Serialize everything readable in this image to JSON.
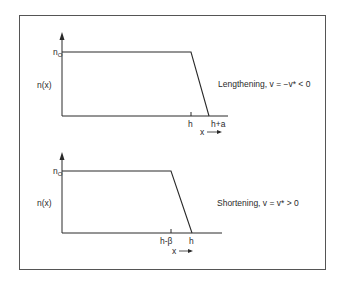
{
  "figure": {
    "panels": [
      {
        "id": "lengthening",
        "y_axis_label": "n(x)",
        "y_level_label": "n",
        "y_level_subscript": "O",
        "x_axis_label": "x",
        "tick_labels": [
          "h",
          "h+a"
        ],
        "caption": "Lengthening, v = −v* < 0"
      },
      {
        "id": "shortening",
        "y_axis_label": "n(x)",
        "y_level_label": "n",
        "y_level_subscript": "O",
        "x_axis_label": "x",
        "tick_labels": [
          "h-β",
          "h"
        ],
        "caption": "Shortening, v = v* > 0"
      }
    ]
  },
  "colors": {
    "line": "#2a2a2a",
    "frame": "#555555",
    "background": "#ffffff"
  }
}
